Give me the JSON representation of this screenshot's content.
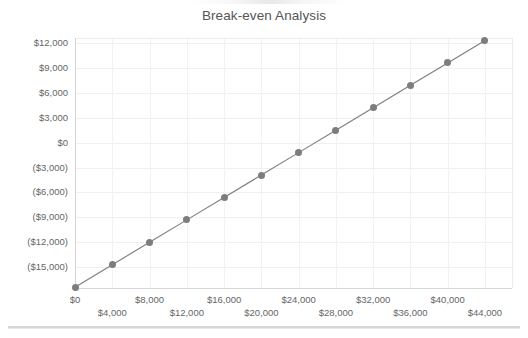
{
  "chart_data": {
    "type": "line",
    "title": "Break-even Analysis",
    "xlabel": "",
    "ylabel": "",
    "grid": true,
    "legend": false,
    "marker": "circle",
    "line_color": "#7d7d7d",
    "marker_color": "#7d7d7d",
    "xlim": [
      0,
      46900
    ],
    "ylim": [
      -17500,
      12600
    ],
    "x": [
      0,
      4000,
      8000,
      12000,
      16000,
      20000,
      24000,
      28000,
      32000,
      36000,
      40000,
      44000
    ],
    "values": [
      -17400,
      -14700,
      -12000,
      -9300,
      -6600,
      -3900,
      -1200,
      1500,
      4200,
      6900,
      9600,
      12300
    ],
    "xticks": [
      0,
      4000,
      8000,
      12000,
      16000,
      20000,
      24000,
      28000,
      32000,
      36000,
      40000,
      44000
    ],
    "xticklabels": [
      "$0",
      "$4,000",
      "$8,000",
      "$12,000",
      "$16,000",
      "$20,000",
      "$24,000",
      "$28,000",
      "$32,000",
      "$36,000",
      "$40,000",
      "$44,000"
    ],
    "yticks": [
      12000,
      9000,
      6000,
      3000,
      0,
      -3000,
      -6000,
      -9000,
      -12000,
      -15000
    ],
    "yticklabels": [
      "$12,000",
      "$9,000",
      "$6,000",
      "$3,000",
      "$0",
      "($3,000)",
      "($6,000)",
      "($9,000)",
      "($12,000)",
      "($15,000)"
    ]
  },
  "colors": {
    "series": "#7d7d7d",
    "grid": "#f0f0f0",
    "axis": "#d4d4d4",
    "text": "#666666",
    "title": "#555555",
    "background": "#ffffff",
    "divider": "#d6d6d6"
  }
}
